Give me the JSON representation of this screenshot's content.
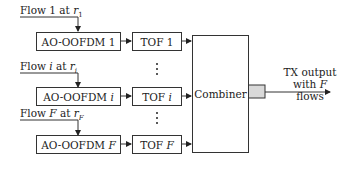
{
  "diagram": {
    "flows": [
      {
        "label_prefix": "Flow ",
        "index": "1",
        "index_italic": false,
        "at": " at ",
        "rate_symbol": "r",
        "rate_sub": "1",
        "modulator": "AO-OOFDM",
        "tof": "TOF"
      },
      {
        "label_prefix": "Flow ",
        "index": "i",
        "index_italic": true,
        "at": " at ",
        "rate_symbol": "r",
        "rate_sub": "i",
        "modulator": "AO-OOFDM",
        "tof": "TOF"
      },
      {
        "label_prefix": "Flow ",
        "index": "F",
        "index_italic": true,
        "at": " at ",
        "rate_symbol": "r",
        "rate_sub": "F",
        "modulator": "AO-OOFDM",
        "tof": "TOF"
      }
    ],
    "combiner_label": "Combiner",
    "output_label_line1": "TX output",
    "output_label_line2_prefix": "with ",
    "output_label_line2_var": "F",
    "output_label_line2_suffix": " flows",
    "colors": {
      "line": "#333333",
      "output_port_fill": "#d9d9d9"
    }
  }
}
